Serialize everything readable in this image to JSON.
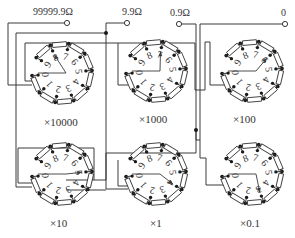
{
  "terminals": [
    {
      "id": "t-max",
      "label": "99999.9Ω"
    },
    {
      "id": "t-9.9",
      "label": "9.9Ω"
    },
    {
      "id": "t-0.9",
      "label": "0.9Ω"
    },
    {
      "id": "t-0",
      "label": "0"
    }
  ],
  "dials": [
    {
      "multiplier": "×10000",
      "setting": 8,
      "numbers": [
        "0",
        "1",
        "2",
        "3",
        "4",
        "5",
        "6",
        "7",
        "8",
        "9"
      ]
    },
    {
      "multiplier": "×1000",
      "setting": 7,
      "numbers": [
        "0",
        "1",
        "2",
        "3",
        "4",
        "5",
        "6",
        "7",
        "8",
        "9"
      ]
    },
    {
      "multiplier": "×100",
      "setting": 6,
      "numbers": [
        "0",
        "1",
        "2",
        "3",
        "4",
        "5",
        "6",
        "7",
        "8",
        "9"
      ]
    },
    {
      "multiplier": "×10",
      "setting": 5,
      "numbers": [
        "0",
        "1",
        "2",
        "3",
        "4",
        "5",
        "6",
        "7",
        "8",
        "9"
      ]
    },
    {
      "multiplier": "×1",
      "setting": 4,
      "numbers": [
        "0",
        "1",
        "2",
        "3",
        "4",
        "5",
        "6",
        "7",
        "8",
        "9"
      ]
    },
    {
      "multiplier": "×0.1",
      "setting": 3,
      "numbers": [
        "0",
        "1",
        "2",
        "3",
        "4",
        "5",
        "6",
        "7",
        "8",
        "9"
      ]
    }
  ],
  "colors": {
    "line": "#3a3a3a",
    "node": "#1a1a1a",
    "background": "#ffffff"
  }
}
